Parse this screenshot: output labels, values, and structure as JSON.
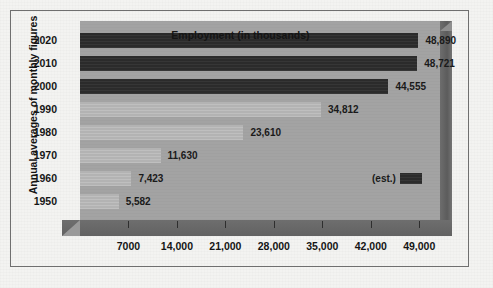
{
  "chart_data": {
    "type": "bar",
    "orientation": "horizontal",
    "title": "",
    "xlabel": "Employment (in thousands)",
    "ylabel": "Annual averages of monthly figures",
    "categories": [
      "2020",
      "2010",
      "2000",
      "1990",
      "1980",
      "1970",
      "1960",
      "1950"
    ],
    "values": [
      48890,
      48721,
      44555,
      34812,
      23610,
      11630,
      7423,
      5582
    ],
    "value_labels": [
      "48,890",
      "48,721",
      "44,555",
      "34,812",
      "23,610",
      "11,630",
      "7,423",
      "5,582"
    ],
    "series": [
      {
        "name": "Employment (in thousands)",
        "values": [
          48890,
          48721,
          44555,
          34812,
          23610,
          11630,
          7423,
          5582
        ]
      }
    ],
    "point_styles": [
      "est",
      "est",
      "est",
      "actual",
      "actual",
      "actual",
      "actual",
      "actual"
    ],
    "xlim": [
      0,
      52000
    ],
    "xticks": [
      7000,
      14000,
      21000,
      28000,
      35000,
      42000,
      49000
    ],
    "xtick_labels": [
      "7000",
      "14,000",
      "21,000",
      "28,000",
      "35,000",
      "42,000",
      "49,000"
    ],
    "grid": false,
    "legend": {
      "position": "inside-right",
      "entries": [
        {
          "label": "(est.)",
          "color": "#2b2b2b"
        }
      ]
    },
    "colors": {
      "estimate_bar": "#2b2b2b",
      "actual_bar": "#b3b3b3",
      "plot_background": "#a3a3a3",
      "base_shadow": "#666666",
      "text": "#161616",
      "frame": "#6f6f6f",
      "page_background": "#f3f3f1"
    }
  }
}
